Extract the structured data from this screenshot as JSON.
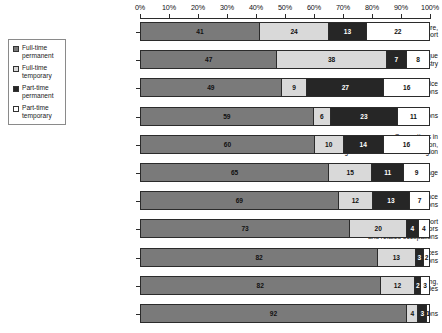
{
  "chart_data": {
    "type": "bar",
    "orientation": "horizontal",
    "stacked": true,
    "stack_unit": "percent",
    "title": "",
    "xlabel": "",
    "ylabel": "",
    "xlim": [
      0,
      100
    ],
    "grid": false,
    "legend_position": "left",
    "axis_ticks": [
      "0%",
      "10%",
      "20%",
      "30%",
      "40%",
      "50%",
      "60%",
      "70%",
      "80%",
      "90%",
      "100%"
    ],
    "axis_tick_values": [
      0,
      10,
      20,
      30,
      40,
      50,
      60,
      70,
      80,
      90,
      100
    ],
    "series": [
      {
        "name": "Full-time permanent",
        "key": "ftp",
        "color": "#7a7a7a",
        "values": [
          41,
          47,
          49,
          59,
          60,
          65,
          69,
          73,
          82,
          82,
          92
        ]
      },
      {
        "name": "Full-time temporary",
        "key": "ftt",
        "color": "#d9d9d9",
        "values": [
          24,
          38,
          9,
          6,
          10,
          15,
          12,
          20,
          13,
          12,
          4
        ]
      },
      {
        "name": "Part-time permanent",
        "key": "ptp",
        "color": "#262626",
        "values": [
          13,
          7,
          27,
          23,
          14,
          11,
          13,
          4,
          3,
          2,
          3
        ]
      },
      {
        "name": "Part-time temporary",
        "key": "ptt",
        "color": "#ffffff",
        "values": [
          22,
          8,
          16,
          11,
          16,
          9,
          7,
          4,
          2,
          3,
          1
        ]
      }
    ],
    "categories": [
      "Occupations in art, culture,\nrecreation and sport",
      "Occupations unique\nto primary industry",
      "Sales and service\noccupations",
      "Health occupations",
      "Occupations in\nsocial science, education,\ngovernment service and religion",
      "Average",
      "Business, finance\nand administrative occupations",
      "Trades, transport\nand equipment operators\nand related occupations",
      "Natural and applied sciences\nand related occupations",
      "Occupations unique to processing,\nmanufacturing and utilities",
      "Management occupations"
    ]
  },
  "legend": {
    "items": [
      {
        "label": "Full-time\npermanent",
        "color": "#7a7a7a"
      },
      {
        "label": "Full-time\ntemporary",
        "color": "#d9d9d9"
      },
      {
        "label": "Part-time\npermanent",
        "color": "#262626"
      },
      {
        "label": "Part-time\ntemporary",
        "color": "#ffffff"
      }
    ]
  }
}
